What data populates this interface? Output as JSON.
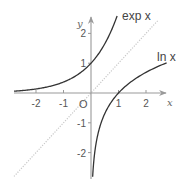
{
  "chart_data": {
    "type": "line",
    "title": "",
    "xlabel": "x",
    "ylabel": "y",
    "origin_label": "O",
    "xlim": [
      -2.8,
      2.7
    ],
    "ylim": [
      -2.9,
      2.5
    ],
    "grid": false,
    "legend": "none (inline curve labels)",
    "x_ticks": [
      {
        "value": -2,
        "label": "-2"
      },
      {
        "value": -1,
        "label": "-1"
      },
      {
        "value": 1,
        "label": "1"
      },
      {
        "value": 2,
        "label": "2"
      }
    ],
    "y_ticks": [
      {
        "value": 2,
        "label": "2"
      },
      {
        "value": 1,
        "label": "1"
      },
      {
        "value": -1,
        "label": "-1"
      },
      {
        "value": -2,
        "label": "-2"
      }
    ],
    "series": [
      {
        "name": "exp x",
        "label": "exp x",
        "function": "exp(x)",
        "style": "solid",
        "color": "#333333",
        "x_range": [
          -2.8,
          0.95
        ],
        "points": [
          [
            -2.8,
            0.061
          ],
          [
            -2,
            0.135
          ],
          [
            -1,
            0.368
          ],
          [
            0,
            1
          ],
          [
            0.5,
            1.649
          ],
          [
            0.95,
            2.586
          ]
        ]
      },
      {
        "name": "ln x",
        "label": "ln x",
        "function": "ln(x)",
        "style": "solid",
        "color": "#333333",
        "x_range": [
          0.06,
          2.75
        ],
        "points": [
          [
            0.06,
            -2.81
          ],
          [
            0.135,
            -2
          ],
          [
            0.368,
            -1
          ],
          [
            1,
            0
          ],
          [
            2,
            0.693
          ],
          [
            2.75,
            1.012
          ]
        ]
      },
      {
        "name": "y = x",
        "label": "",
        "function": "x",
        "style": "dotted",
        "color": "#bbbbbb",
        "x_range": [
          -2.8,
          2.45
        ],
        "points": [
          [
            -2.8,
            -2.8
          ],
          [
            2.45,
            2.45
          ]
        ]
      }
    ]
  },
  "layout": {
    "origin_px": [
      91,
      93
    ],
    "px_per_unit_x": 27.5,
    "px_per_unit_y": 29.8,
    "axis_color": "#999999",
    "curve_color": "#333333",
    "dotted_color": "#c8c8c8"
  }
}
